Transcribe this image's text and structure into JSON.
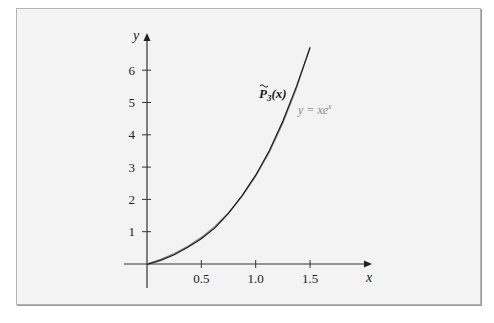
{
  "chart_data": {
    "type": "line",
    "title": "",
    "xlabel": "x",
    "ylabel": "y",
    "xlim": [
      0,
      2.07
    ],
    "ylim": [
      0,
      7.15
    ],
    "grid": false,
    "legend": "inline labels near curves",
    "x_ticks": [
      0.5,
      1.0,
      1.5
    ],
    "x_tick_labels": [
      "0.5",
      "1.0",
      "1.5"
    ],
    "y_ticks": [
      1,
      2,
      3,
      4,
      5,
      6
    ],
    "y_tick_labels": [
      "1",
      "2",
      "3",
      "4",
      "5",
      "6"
    ],
    "series": [
      {
        "name": "y = xe^x",
        "label_main": "y = xe",
        "label_sup": "x",
        "color": "#8c8c8c",
        "x": [
          0,
          0.125,
          0.25,
          0.375,
          0.5,
          0.625,
          0.75,
          0.875,
          1.0,
          1.125,
          1.25,
          1.375,
          1.5
        ],
        "values": [
          0,
          0.142,
          0.321,
          0.546,
          0.824,
          1.164,
          1.588,
          2.099,
          2.718,
          3.465,
          4.363,
          5.438,
          6.723
        ]
      },
      {
        "name": "P̃3(x)",
        "label_main": "P",
        "label_sub": "3",
        "label_tail": "(x)",
        "color": "#1a1a1a",
        "x": [
          0,
          0.125,
          0.25,
          0.375,
          0.5,
          0.625,
          0.75,
          0.875,
          1.0,
          1.125,
          1.25,
          1.375,
          1.5
        ],
        "values": [
          -0.01,
          0.111,
          0.287,
          0.516,
          0.78,
          1.117,
          1.567,
          2.117,
          2.75,
          3.504,
          4.43,
          5.499,
          6.7
        ]
      }
    ],
    "annotations": [
      {
        "text": "P̃3(x)",
        "x": 1.03,
        "y": 5.3
      },
      {
        "text": "y = xe^x",
        "x": 1.39,
        "y": 4.7
      }
    ]
  },
  "plot": {
    "origin_px": [
      147,
      264
    ],
    "px_per_x": 108.7,
    "px_per_y": 32.3,
    "x_axis_end_px": 372,
    "y_axis_end_px": 33,
    "y_axis_bottom_px": 288,
    "x_axis_left_px": 124
  }
}
